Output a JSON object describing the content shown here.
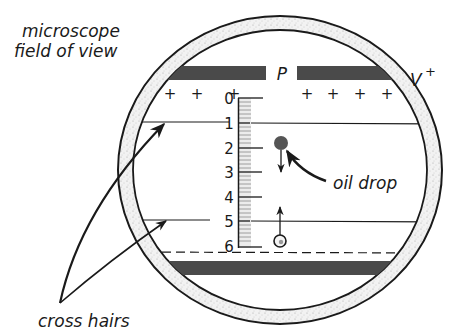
{
  "labels": {
    "field_of_view_line1": "microscope",
    "field_of_view_line2": "field of view",
    "cross_hairs": "cross hairs",
    "oil_drop": "oil drop",
    "plate": "P",
    "voltage": "V",
    "voltage_sign": "+"
  },
  "charges": {
    "left": [
      "+",
      "+",
      "+"
    ],
    "right": [
      "+",
      "+",
      "+",
      "+"
    ]
  },
  "scale": {
    "ticks": [
      "0",
      "1",
      "2",
      "3",
      "4",
      "5",
      "6"
    ]
  },
  "colors": {
    "ink": "#1a1a1a",
    "plate": "#4a4a4a",
    "ring_fill": "#e8e8e8",
    "drop_dark": "#555555",
    "drop_light": "#f4f4f4"
  }
}
